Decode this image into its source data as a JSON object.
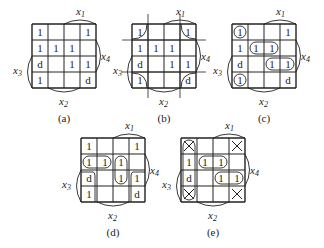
{
  "figure": {
    "maps": [
      {
        "id": "a",
        "caption": "(a)",
        "x": 32,
        "y": 24,
        "cells": [
          [
            "1",
            "",
            "",
            "1"
          ],
          [
            "1",
            "1",
            "1",
            ""
          ],
          [
            "d",
            "",
            "1",
            "1"
          ],
          [
            "1",
            "",
            "",
            "d"
          ]
        ],
        "variant": "plain"
      },
      {
        "id": "b",
        "caption": "(b)",
        "x": 132,
        "y": 24,
        "cells": [
          [
            "1",
            "",
            "",
            "1"
          ],
          [
            "1",
            "1",
            "1",
            ""
          ],
          [
            "d",
            "",
            "1",
            "1"
          ],
          [
            "1",
            "",
            "",
            "d"
          ]
        ],
        "variant": "corners"
      },
      {
        "id": "c",
        "caption": "(c)",
        "x": 232,
        "y": 24,
        "cells": [
          [
            "1",
            "",
            "",
            "1"
          ],
          [
            "1",
            "1",
            "1",
            ""
          ],
          [
            "d",
            "",
            "1",
            "1"
          ],
          [
            "1",
            "",
            "",
            "d"
          ]
        ],
        "variant": "groups_c"
      },
      {
        "id": "d",
        "caption": "(d)",
        "x": 81,
        "y": 138,
        "cells": [
          [
            "1",
            "",
            "",
            "1"
          ],
          [
            "1",
            "1",
            "1",
            ""
          ],
          [
            "d",
            "",
            "1",
            "1"
          ],
          [
            "1",
            "",
            "",
            "d"
          ]
        ],
        "variant": "groups_d"
      },
      {
        "id": "e",
        "caption": "(e)",
        "x": 181,
        "y": 138,
        "cells": [
          [
            "X",
            "",
            "",
            "X"
          ],
          [
            "1",
            "1",
            "1",
            ""
          ],
          [
            "d",
            "",
            "1",
            "1"
          ],
          [
            "X",
            "",
            "",
            "X"
          ]
        ],
        "variant": "groups_e"
      }
    ],
    "labels": {
      "x1": "x",
      "x1_sub": "1",
      "x2": "x",
      "x2_sub": "2",
      "x3": "x",
      "x3_sub": "3",
      "x4": "x",
      "x4_sub": "4"
    }
  }
}
